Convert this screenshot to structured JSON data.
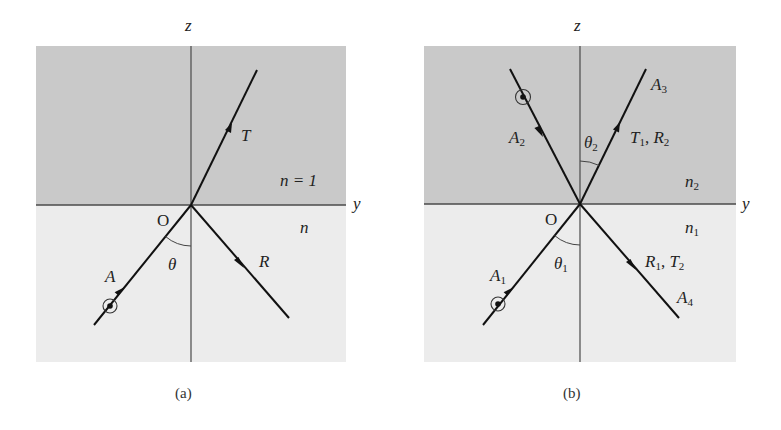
{
  "colors": {
    "upper_medium": "#c9c9c9",
    "lower_medium": "#ececec",
    "axis": "#4a4a4a",
    "ray": "#111111"
  },
  "figure_a": {
    "caption": "(a)",
    "axis_z": "z",
    "axis_y": "y",
    "origin": "O",
    "upper_medium": "n = 1",
    "lower_medium": "n",
    "incident": "A",
    "transmitted": "T",
    "reflected": "R",
    "angle": "θ"
  },
  "figure_b": {
    "caption": "(b)",
    "axis_z": "z",
    "axis_y": "y",
    "origin": "O",
    "upper_medium": {
      "base": "n",
      "sub": "2"
    },
    "lower_medium": {
      "base": "n",
      "sub": "1"
    },
    "incident_lower": {
      "base": "A",
      "sub": "1"
    },
    "incident_upper": {
      "base": "A",
      "sub": "2"
    },
    "outgoing_upper": {
      "base": "A",
      "sub": "3"
    },
    "outgoing_lower": {
      "base": "A",
      "sub": "4"
    },
    "upper_ray_label": {
      "a": "T",
      "a_sub": "1",
      "sep": ", ",
      "b": "R",
      "b_sub": "2"
    },
    "lower_ray_label": {
      "a": "R",
      "a_sub": "1",
      "sep": ", ",
      "b": "T",
      "b_sub": "2"
    },
    "angle_upper": {
      "base": "θ",
      "sub": "2"
    },
    "angle_lower": {
      "base": "θ",
      "sub": "1"
    }
  }
}
